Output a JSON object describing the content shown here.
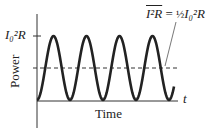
{
  "chart_data": {
    "type": "line",
    "title": "",
    "xlabel": "Time",
    "ylabel": "Power",
    "x_axis_end_label": "t",
    "y_tick_label": "I_0^2 R",
    "series": [
      {
        "name": "Instantaneous power P = I_0^2 R sin^2(wt)",
        "style": "solid",
        "cycles": 4,
        "min": 0,
        "max": 1
      }
    ],
    "reference_lines": [
      {
        "name": "average power",
        "style": "dashed",
        "value": 0.5,
        "label": "overline(I^2 R) = 1/2 I_0^2 R"
      }
    ],
    "ylim": [
      0,
      1
    ]
  },
  "labels": {
    "peak": "I₀²R",
    "avg_lhs": "I²R",
    "avg_eq": " = ",
    "avg_half": "½",
    "avg_rhs": "I₀²R",
    "ylabel": "Power",
    "xlabel": "Time",
    "t": "t"
  }
}
